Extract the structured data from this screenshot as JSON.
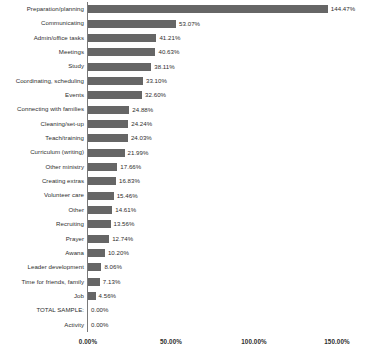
{
  "chart_data": {
    "type": "bar",
    "orientation": "horizontal",
    "title": "",
    "xlabel": "",
    "ylabel": "",
    "xlim": [
      0,
      150
    ],
    "grid": false,
    "legend": null,
    "value_suffix": "%",
    "axis_ticks": [
      "0.00%",
      "50.00%",
      "100.00%",
      "150.00%"
    ],
    "axis_tick_values": [
      0,
      50,
      100,
      150
    ],
    "categories": [
      "Preparation/planning",
      "Communicating",
      "Admin/office tasks",
      "Meetings",
      "Study",
      "Coordinating, scheduling",
      "Events",
      "Connecting with families",
      "Cleaning/set-up",
      "Teach/training",
      "Curriculum (writing)",
      "Other ministry",
      "Creating extras",
      "Volunteer care",
      "Other",
      "Recruiting",
      "Prayer",
      "Awana",
      "Leader development",
      "Time for friends, family",
      "Job",
      "TOTAL SAMPLE:",
      "Activity"
    ],
    "values": [
      144.47,
      53.07,
      41.21,
      40.63,
      38.11,
      33.1,
      32.6,
      24.88,
      24.24,
      24.03,
      21.99,
      17.66,
      16.83,
      15.46,
      14.61,
      13.56,
      12.74,
      10.2,
      8.06,
      7.13,
      4.56,
      0.0,
      0.0
    ],
    "value_labels": [
      "144.47%",
      "53.07%",
      "41.21%",
      "40.63%",
      "38.11%",
      "33.10%",
      "32.60%",
      "24.88%",
      "24.24%",
      "24.03%",
      "21.99%",
      "17.66%",
      "16.83%",
      "15.46%",
      "14.61%",
      "13.56%",
      "12.74%",
      "10.20%",
      "8.06%",
      "7.13%",
      "4.56%",
      "0.00%",
      "0.00%"
    ],
    "colors": {
      "bar": "#666666",
      "axis": "#7a7a7a",
      "text": "#2e2e2e",
      "background": "#ffffff"
    }
  }
}
